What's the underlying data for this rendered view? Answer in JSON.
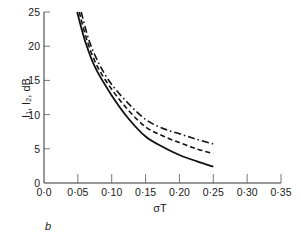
{
  "chart_data": {
    "type": "line",
    "title": "",
    "panel_label": "b",
    "xlabel": "σT",
    "ylabel": "I₁, I₂, dB",
    "xlim": [
      0.0,
      0.35
    ],
    "ylim": [
      0,
      25
    ],
    "grid": false,
    "legend": null,
    "x_ticks": [
      "0·0",
      "0·05",
      "0·10",
      "0·15",
      "0·20",
      "0·25",
      "0·30",
      "0·35"
    ],
    "y_ticks": [
      "0",
      "5",
      "10",
      "15",
      "20",
      "25"
    ],
    "series": [
      {
        "name": "solid",
        "style": "solid",
        "x": [
          0.049,
          0.06,
          0.075,
          0.1,
          0.125,
          0.15,
          0.175,
          0.2,
          0.225,
          0.25
        ],
        "values": [
          25.0,
          21.0,
          17.0,
          12.8,
          9.4,
          6.8,
          5.3,
          4.1,
          3.2,
          2.4
        ]
      },
      {
        "name": "dashed",
        "style": "dashed",
        "x": [
          0.052,
          0.063,
          0.078,
          0.1,
          0.125,
          0.15,
          0.175,
          0.2,
          0.225,
          0.25
        ],
        "values": [
          25.0,
          21.0,
          17.2,
          13.7,
          10.6,
          8.2,
          6.9,
          5.9,
          5.0,
          4.3
        ]
      },
      {
        "name": "dash-dot",
        "style": "dashdot",
        "x": [
          0.055,
          0.066,
          0.081,
          0.1,
          0.125,
          0.15,
          0.175,
          0.2,
          0.225,
          0.25
        ],
        "values": [
          25.0,
          21.0,
          17.5,
          14.4,
          11.6,
          9.3,
          8.0,
          7.2,
          6.4,
          5.7
        ]
      }
    ]
  }
}
